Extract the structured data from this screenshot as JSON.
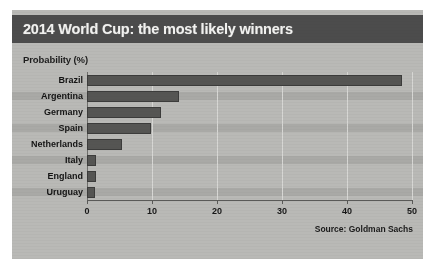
{
  "figure": {
    "title": "2014 World Cup: the most likely winners",
    "axis_title": "Probability (%)",
    "source": "Source: Goldman Sachs",
    "colors": {
      "title_bar": "#4c4c4c",
      "title_text": "#f2f2f0",
      "panel_background": "#b9b9b6",
      "band": "#a9a9a6",
      "bar": "#555553",
      "gridline": "#d7d7d4",
      "axis": "#5a5a58"
    }
  },
  "chart_data": {
    "type": "bar",
    "orientation": "horizontal",
    "title": "2014 World Cup: the most likely winners",
    "xlabel": "Probability (%)",
    "ylabel": "",
    "categories": [
      "Brazil",
      "Argentina",
      "Germany",
      "Spain",
      "Netherlands",
      "Italy",
      "England",
      "Uruguay"
    ],
    "values": [
      48.5,
      14.1,
      11.4,
      9.8,
      5.4,
      1.4,
      1.4,
      1.2
    ],
    "xlim": [
      0,
      50
    ],
    "xticks": [
      0,
      10,
      20,
      30,
      40,
      50
    ],
    "xtick_labels": [
      "0",
      "10",
      "20",
      "30",
      "40",
      "50"
    ],
    "grid": true,
    "legend": false,
    "annotations": [
      "Source: Goldman Sachs"
    ]
  }
}
